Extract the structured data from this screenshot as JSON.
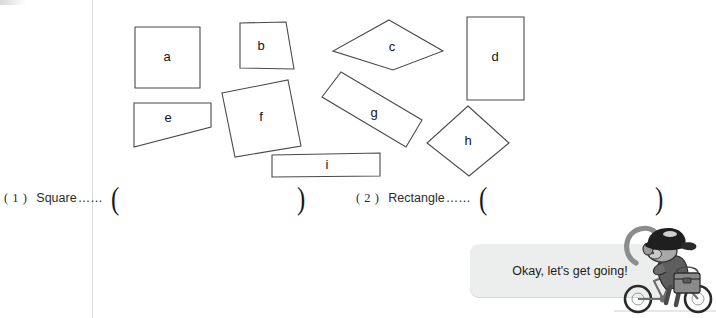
{
  "worksheet": {
    "title": "Shape Sorting Worksheet",
    "instruction_note": ""
  },
  "shapes": [
    {
      "label": "a",
      "kind": "square",
      "cx": 167,
      "cy": 57
    },
    {
      "label": "b",
      "kind": "trapezoid",
      "cx": 262,
      "cy": 48
    },
    {
      "label": "c",
      "kind": "parallelogram",
      "cx": 393,
      "cy": 48
    },
    {
      "label": "d",
      "kind": "rectangle",
      "cx": 495,
      "cy": 58
    },
    {
      "label": "e",
      "kind": "trapezoid",
      "cx": 167,
      "cy": 119
    },
    {
      "label": "f",
      "kind": "tilted-square",
      "cx": 262,
      "cy": 118
    },
    {
      "label": "g",
      "kind": "tilted-rectangle",
      "cx": 374,
      "cy": 114
    },
    {
      "label": "h",
      "kind": "diamond",
      "cx": 469,
      "cy": 141
    },
    {
      "label": "i",
      "kind": "thin-rectangle",
      "cx": 328,
      "cy": 165
    }
  ],
  "questions": [
    {
      "number": "( 1 )",
      "label": "Square",
      "dots": "……",
      "open_paren": "(",
      "close_paren": ")",
      "answer": ""
    },
    {
      "number": "( 2 )",
      "label": "Rectangle",
      "dots": "……",
      "open_paren": "(",
      "close_paren": ")",
      "answer": ""
    }
  ],
  "speech": {
    "text": "Okay, let's get going!",
    "bubble_color": "#eceded"
  },
  "mascot": {
    "name": "monkey-on-bicycle",
    "description": "monkey wearing a cap riding a bicycle with a satchel"
  },
  "colors": {
    "page_background": "#ffffff",
    "shape_stroke": "#4a4a4a",
    "text": "#1a1a1a",
    "margin_rule": "#dcdcdc"
  }
}
